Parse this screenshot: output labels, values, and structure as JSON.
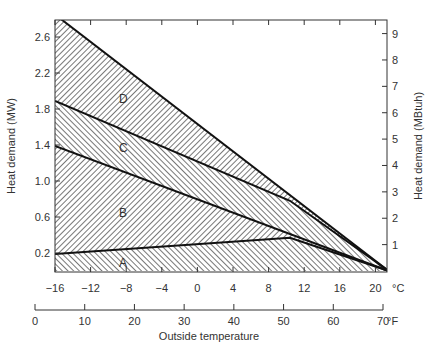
{
  "chart_data": {
    "type": "area",
    "title": "",
    "xlabel": "Outside temperature",
    "ylabel": "Heat demand (MW)",
    "ylabel_right": "Heat demand (MBtuh)",
    "x_unit_primary": "°C",
    "x_unit_secondary": "°F",
    "xlim_celsius": [
      -16,
      21.5
    ],
    "ylim": [
      0,
      2.8
    ],
    "ylim_right": [
      0,
      9.55
    ],
    "x_ticks_celsius": [
      "−16",
      "−12",
      "−8",
      "−4",
      "0",
      "4",
      "8",
      "12",
      "16",
      "20"
    ],
    "x_ticks_fahrenheit": [
      "0",
      "10",
      "20",
      "30",
      "40",
      "50",
      "60",
      "70"
    ],
    "y_ticks_left": [
      "0.2",
      "0.6",
      "1.0",
      "1.4",
      "1.8",
      "2.2",
      "2.6"
    ],
    "y_ticks_right": [
      "1",
      "2",
      "3",
      "4",
      "5",
      "6",
      "7",
      "8",
      "9"
    ],
    "grid": false,
    "legend": "none (regions labeled inline A–D)",
    "lines": [
      {
        "name": "total (top of D)",
        "x": [
          -16,
          21.5
        ],
        "y": [
          2.85,
          0
        ]
      },
      {
        "name": "C/D boundary",
        "x": [
          -16,
          10.4,
          21.5
        ],
        "y": [
          1.89,
          0.78,
          0
        ]
      },
      {
        "name": "B/C boundary",
        "x": [
          -16,
          21.5
        ],
        "y": [
          1.39,
          0
        ]
      },
      {
        "name": "A/B boundary",
        "x": [
          -16,
          10.4,
          21.5
        ],
        "y": [
          0.19,
          0.37,
          0
        ]
      }
    ],
    "regions": [
      {
        "label": "A",
        "x": -8,
        "y": 0.08,
        "hatch": "forward"
      },
      {
        "label": "B",
        "x": -8,
        "y": 0.74,
        "hatch": "back"
      },
      {
        "label": "C",
        "x": -8,
        "y": 1.44,
        "hatch": "forward"
      },
      {
        "label": "D",
        "x": -8,
        "y": 1.96,
        "hatch": "back"
      }
    ]
  },
  "labels": {
    "y_left_title": "Heat demand (MW)",
    "y_right_title": "Heat demand (MBtuh)",
    "x_title": "Outside temperature",
    "unit_c": "°C",
    "unit_f": "°F",
    "region_a": "A",
    "region_b": "B",
    "region_c": "C",
    "region_d": "D"
  },
  "colors": {
    "line": "#111111",
    "hatch": "#555555",
    "text": "#333333"
  }
}
